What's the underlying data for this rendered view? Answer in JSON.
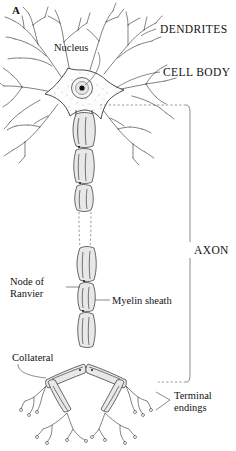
{
  "figure": {
    "panel_letter": "A",
    "background_color": "#ffffff",
    "ink_color": "#2b2b2b"
  },
  "labels": {
    "dendrites": "DENDRITES",
    "cell_body": "CELL BODY",
    "axon": "AXON",
    "nucleus": "Nucleus",
    "node_of_ranvier_line1": "Node of",
    "node_of_ranvier_line2": "Ranvier",
    "myelin_sheath": "Myelin sheath",
    "collateral": "Collateral",
    "terminal_endings_line1": "Terminal",
    "terminal_endings_line2": "endings"
  }
}
